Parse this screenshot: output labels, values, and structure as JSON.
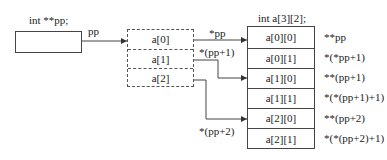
{
  "diagram": {
    "pointer_var": {
      "declaration": "int **pp;",
      "name_label": "pp"
    },
    "pointer_array": {
      "cells": [
        "a[0]",
        "a[1]",
        "a[2]"
      ]
    },
    "arrows": [
      {
        "label": "*pp",
        "from": "a[0]",
        "to": "a[0][0]"
      },
      {
        "label": "*(pp+1)",
        "from": "a[1]",
        "to": "a[1][0]"
      },
      {
        "label": "*(pp+2)",
        "from": "a[2]",
        "to": "a[2][0]"
      }
    ],
    "array2d": {
      "declaration": "int a[3][2];",
      "cells": [
        "a[0][0]",
        "a[0][1]",
        "a[1][0]",
        "a[1][1]",
        "a[2][0]",
        "a[2][1]"
      ],
      "expressions": [
        "**pp",
        "*(*pp+1)",
        "**(pp+1)",
        "*(*(pp+1)+1)",
        "**(pp+2)",
        "*(*(pp+2)+1)"
      ]
    },
    "colors": {
      "line": "#444444",
      "text": "#222222",
      "background": "#ffffff"
    }
  }
}
